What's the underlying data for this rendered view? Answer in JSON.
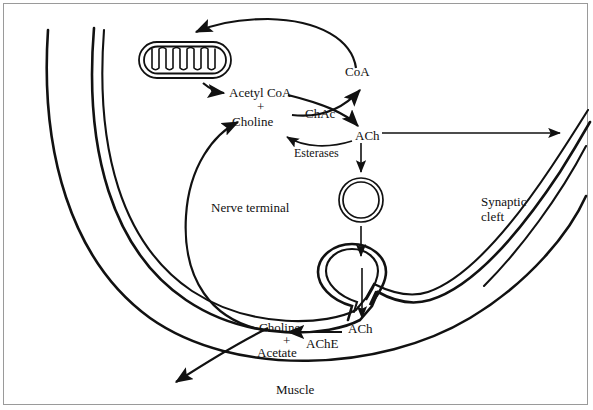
{
  "figure": {
    "background_color": "#ffffff",
    "line_color": "#111111",
    "frame_color": "#9a9a9a"
  },
  "labels": {
    "coa": "CoA",
    "acetyl_coa": "Acetyl CoA",
    "plus_top": "+",
    "choline_top": "Choline",
    "chac": "ChAc",
    "ach_top": "ACh",
    "esterases": "Esterases",
    "nerve_terminal": "Nerve terminal",
    "synaptic_cleft_line1": "Synaptic",
    "synaptic_cleft_line2": "cleft",
    "choline_bottom": "Choline",
    "plus_bottom": "+",
    "acetate": "Acetate",
    "ache": "AChE",
    "ach_bottom": "ACh",
    "muscle": "Muscle"
  },
  "structures": {
    "mitochondrion": "mitochondrion-organelle",
    "vesicle_free": "synaptic-vesicle",
    "vesicle_fusing": "fusing-vesicle-omega",
    "presynaptic_membrane": "nerve-terminal-membrane",
    "postsynaptic_membrane": "muscle-membrane"
  },
  "arrows": [
    {
      "name": "coa-recycle-to-mitochondrion",
      "from": "CoA",
      "to": "mitochondrion"
    },
    {
      "name": "mitochondrion-to-acetyl-coa",
      "from": "mitochondrion",
      "to": "Acetyl CoA"
    },
    {
      "name": "acetyl-coa-to-ach",
      "from": "Acetyl CoA",
      "to": "ACh",
      "enzyme": "ChAc"
    },
    {
      "name": "choline-to-coa",
      "from": "Choline",
      "to": "CoA",
      "enzyme": "ChAc"
    },
    {
      "name": "ach-to-choline-esterases",
      "from": "ACh",
      "to": "Choline",
      "enzyme": "Esterases"
    },
    {
      "name": "ach-export-to-cleft",
      "from": "ACh",
      "to": "synaptic cleft"
    },
    {
      "name": "ach-to-vesicle",
      "from": "ACh",
      "to": "vesicle"
    },
    {
      "name": "vesicle-to-fusion-site",
      "from": "vesicle",
      "to": "fusing vesicle"
    },
    {
      "name": "release-into-cleft",
      "from": "fusing vesicle",
      "to": "ACh"
    },
    {
      "name": "ach-hydrolysis",
      "from": "ACh",
      "to": "Choline + Acetate",
      "enzyme": "AChE"
    },
    {
      "name": "choline-reuptake",
      "from": "Choline",
      "to": "Choline pool in terminal"
    },
    {
      "name": "signal-to-muscle",
      "from": "synaptic cleft",
      "to": "Muscle"
    }
  ]
}
